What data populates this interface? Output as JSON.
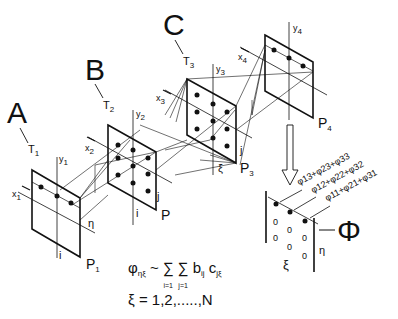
{
  "diagram": {
    "stations": [
      {
        "letter": "A",
        "T": "T1",
        "x": "x1",
        "y": "y1",
        "plane": "P1"
      },
      {
        "letter": "B",
        "T": "T2",
        "x": "x2",
        "y": "y2",
        "plane": "P"
      },
      {
        "letter": "C",
        "T": "T3",
        "x": "x3",
        "y": "y3",
        "plane": "P3"
      },
      {
        "letter": "",
        "T": "",
        "x": "x4",
        "y": "y4",
        "plane": "P4"
      }
    ],
    "labels": {
      "A": "A",
      "B": "B",
      "C": "C",
      "T1": "T",
      "T1_sub": "1",
      "T2": "T",
      "T2_sub": "2",
      "T3": "T",
      "T3_sub": "3",
      "x1": "x",
      "x1_sub": "1",
      "y1": "y",
      "y1_sub": "1",
      "x2": "x",
      "x2_sub": "2",
      "y2": "y",
      "y2_sub": "2",
      "x3": "x",
      "x3_sub": "3",
      "y3": "y",
      "y3_sub": "3",
      "x4": "x",
      "x4_sub": "4",
      "y4": "y",
      "y4_sub": "4",
      "P1": "P",
      "P1_sub": "1",
      "P": "P",
      "P3": "P",
      "P3_sub": "3",
      "P4": "P",
      "P4_sub": "4",
      "eta": "η",
      "i_a": "i",
      "i_b": "i",
      "j_b": "j",
      "j_c": "j",
      "xi_c": "ξ",
      "xi_out": "ξ",
      "eta_out": "η",
      "Phi": "Φ"
    },
    "sums": {
      "row1": "φ13+φ23+φ33",
      "row2": "φ12+φ22+φ32",
      "row3": "φ11+φ21+φ31"
    },
    "matrix_zeros": [
      "0",
      "0",
      "0",
      "0",
      "0",
      "0"
    ],
    "formula": {
      "line1_lhs": "φ",
      "line1_lhs_sub": "ηξ",
      "line1_rel": "~",
      "sum1_sym": "∑",
      "sum1_lower": "i=1",
      "sum2_sym": "∑",
      "sum2_lower": "j=1",
      "b": "b",
      "b_sub": "ij",
      "c": "c",
      "c_sub": "jξ",
      "line2": "ξ = 1,2,.....,N"
    }
  }
}
